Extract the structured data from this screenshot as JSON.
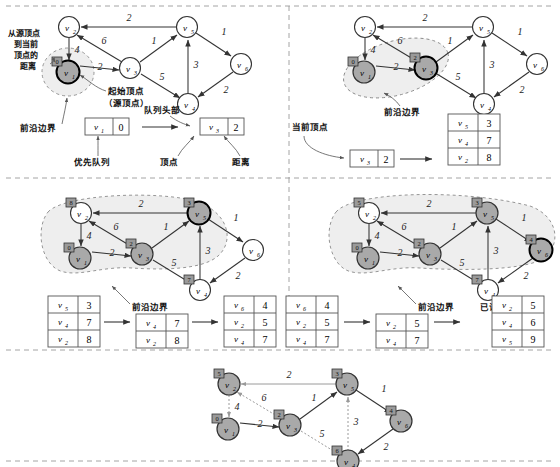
{
  "figure": {
    "colors": {
      "node_fill_unvisited": "#ffffff",
      "node_fill_visited": "#a9a9a9",
      "node_stroke": "#333333",
      "current_node_stroke": "#000000",
      "frontier_fill": "#eeeeee",
      "frontier_stroke": "#888888",
      "edge": "#333333",
      "badge_fill": "#9a9a9a",
      "badge_stroke": "#333333",
      "table_stroke": "#555555",
      "divider": "#999999",
      "leader": "#555555"
    }
  },
  "graph": {
    "vertices": [
      "v1",
      "v2",
      "v3",
      "v4",
      "v5",
      "v6"
    ],
    "vertex_labels": {
      "v1": "v",
      "v2": "v",
      "v3": "v",
      "v4": "v",
      "v5": "v",
      "v6": "v"
    },
    "vertex_subscripts": {
      "v1": "1",
      "v2": "2",
      "v3": "3",
      "v4": "4",
      "v5": "5",
      "v6": "6"
    },
    "edges": [
      {
        "from": "v5",
        "to": "v2",
        "weight": "2"
      },
      {
        "from": "v3",
        "to": "v2",
        "weight": "6"
      },
      {
        "from": "v2",
        "to": "v1",
        "weight": "4"
      },
      {
        "from": "v1",
        "to": "v3",
        "weight": "2"
      },
      {
        "from": "v3",
        "to": "v5",
        "weight": "1"
      },
      {
        "from": "v3",
        "to": "v4",
        "weight": "5"
      },
      {
        "from": "v4",
        "to": "v5",
        "weight": "3"
      },
      {
        "from": "v5",
        "to": "v6",
        "weight": "1"
      },
      {
        "from": "v6",
        "to": "v4",
        "weight": "2"
      }
    ]
  },
  "labels": {
    "distance_from_source": "从源顶点\n到当前\n顶点的\n距离",
    "distance_from_source_lines": [
      "从源顶点",
      "到当前",
      "顶点的",
      "距离"
    ],
    "start_vertex": "起始顶点",
    "start_vertex_sub": "（源顶点）",
    "frontier": "前沿边界",
    "priority_queue": "优先队列",
    "queue_head": "队列头部",
    "vertex": "顶点",
    "distance": "距离",
    "current_vertex": "当前顶点",
    "visited_vertices": "已访问过的顶点"
  },
  "panels": [
    {
      "id": "panel-1",
      "visited": [],
      "current": "v1",
      "badges": {
        "v1": "0"
      },
      "frontier_nodes": [
        "v1"
      ],
      "highlight_edges": [],
      "tables": [
        {
          "rows": [
            {
              "vertex": "v",
              "sub": "1",
              "dist": "0"
            }
          ]
        },
        {
          "rows": [
            {
              "vertex": "v",
              "sub": "3",
              "dist": "2"
            }
          ]
        }
      ],
      "annotations": [
        "distance_from_source",
        "start_vertex",
        "frontier",
        "priority_queue",
        "queue_head",
        "vertex",
        "distance"
      ]
    },
    {
      "id": "panel-2",
      "visited": [
        "v1"
      ],
      "current": "v3",
      "badges": {
        "v1": "0",
        "v3": "2"
      },
      "frontier_nodes": [
        "v1",
        "v3"
      ],
      "tables": [
        {
          "rows": [
            {
              "vertex": "v",
              "sub": "3",
              "dist": "2"
            }
          ]
        },
        {
          "rows": [
            {
              "vertex": "v",
              "sub": "5",
              "dist": "3"
            },
            {
              "vertex": "v",
              "sub": "4",
              "dist": "7"
            },
            {
              "vertex": "v",
              "sub": "2",
              "dist": "8"
            }
          ]
        }
      ],
      "annotations": [
        "frontier",
        "current_vertex"
      ]
    },
    {
      "id": "panel-3",
      "visited": [
        "v1",
        "v3"
      ],
      "current": "v5",
      "badges": {
        "v1": "0",
        "v3": "2",
        "v5": "3",
        "v4": "7",
        "v2": "8"
      },
      "frontier_nodes": [
        "v1",
        "v2",
        "v3",
        "v4",
        "v5"
      ],
      "tables": [
        {
          "rows": [
            {
              "vertex": "v",
              "sub": "5",
              "dist": "3"
            },
            {
              "vertex": "v",
              "sub": "4",
              "dist": "7"
            },
            {
              "vertex": "v",
              "sub": "2",
              "dist": "8"
            }
          ]
        },
        {
          "rows": [
            {
              "vertex": "v",
              "sub": "4",
              "dist": "7"
            },
            {
              "vertex": "v",
              "sub": "2",
              "dist": "8"
            }
          ]
        },
        {
          "rows": [
            {
              "vertex": "v",
              "sub": "6",
              "dist": "4"
            },
            {
              "vertex": "v",
              "sub": "2",
              "dist": "5"
            },
            {
              "vertex": "v",
              "sub": "4",
              "dist": "7"
            }
          ]
        }
      ],
      "annotations": [
        "frontier"
      ]
    },
    {
      "id": "panel-4",
      "visited": [
        "v1",
        "v3",
        "v5"
      ],
      "current": "v6",
      "badges": {
        "v1": "0",
        "v3": "2",
        "v5": "3",
        "v6": "4",
        "v2": "5",
        "v4": "7"
      },
      "frontier_nodes": [
        "v1",
        "v2",
        "v3",
        "v4",
        "v5",
        "v6"
      ],
      "tables": [
        {
          "rows": [
            {
              "vertex": "v",
              "sub": "6",
              "dist": "4"
            },
            {
              "vertex": "v",
              "sub": "2",
              "dist": "5"
            },
            {
              "vertex": "v",
              "sub": "4",
              "dist": "7"
            }
          ]
        },
        {
          "rows": [
            {
              "vertex": "v",
              "sub": "2",
              "dist": "5"
            },
            {
              "vertex": "v",
              "sub": "4",
              "dist": "7"
            }
          ]
        },
        {
          "rows": [
            {
              "vertex": "v",
              "sub": "2",
              "dist": "5"
            },
            {
              "vertex": "v",
              "sub": "4",
              "dist": "6"
            },
            {
              "vertex": "v",
              "sub": "5",
              "dist": "9"
            }
          ]
        }
      ],
      "annotations": [
        "frontier",
        "visited_vertices"
      ]
    },
    {
      "id": "panel-5",
      "visited": [
        "v1",
        "v2",
        "v3",
        "v4",
        "v5",
        "v6"
      ],
      "current": null,
      "badges": {
        "v1": "0",
        "v3": "2",
        "v5": "3",
        "v6": "4",
        "v2": "5",
        "v4": "6"
      },
      "frontier_nodes": [],
      "tables": [],
      "annotations": []
    }
  ]
}
